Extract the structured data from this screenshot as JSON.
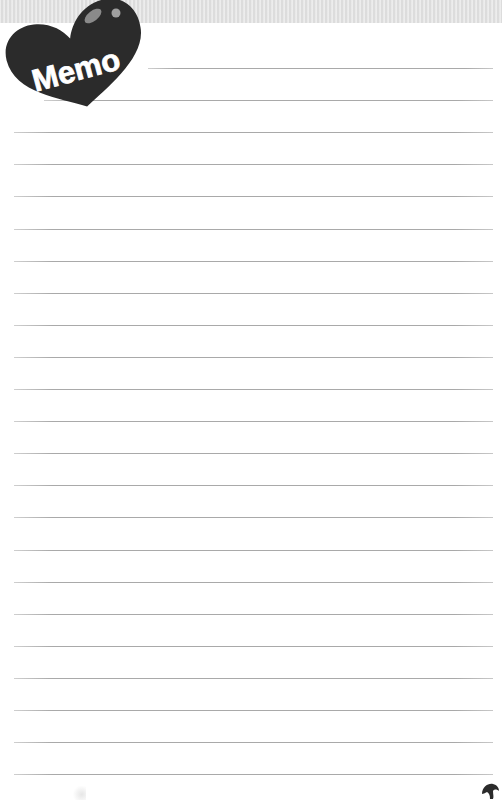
{
  "header": {
    "badge_label": "Memo",
    "badge_icon": "heart-icon",
    "badge_color": "#2b2b2b",
    "band_color": "#e3e3e3"
  },
  "page": {
    "line_count": 23,
    "first_line_y": 68,
    "line_spacing": 32.1,
    "line_left": 14,
    "line_right": 493,
    "first_line_left": 148,
    "second_line_left": 14,
    "line_color": "#a9a9a9"
  },
  "footer": {
    "corner_icon": "leaf-mark-icon"
  }
}
